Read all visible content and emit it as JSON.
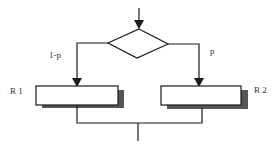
{
  "diagram": {
    "type": "flowchart",
    "decision": {
      "shape": "diamond"
    },
    "branches": [
      {
        "label": "1-p",
        "target": "R 1"
      },
      {
        "label": "p",
        "target": "R 2"
      }
    ],
    "boxes": [
      {
        "label": "R 1"
      },
      {
        "label": "R 2"
      }
    ],
    "colors": {
      "line": "#1a1a1a",
      "shadow": "#555555",
      "box_fill": "#ffffff"
    }
  }
}
